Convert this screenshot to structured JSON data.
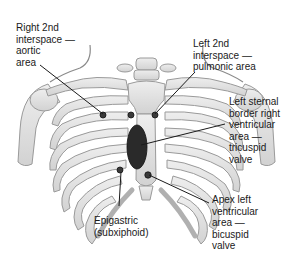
{
  "diagram": {
    "colors": {
      "bone_fill": "#e4e4e4",
      "bone_stroke": "#9a9a9a",
      "heart_area": "#2a2a2a",
      "leader_line": "#1a1a1a",
      "text": "#1a1a1a"
    },
    "labels": [
      {
        "id": "aortic",
        "lines": [
          "Right 2nd",
          "interspace —",
          "aortic",
          "area"
        ]
      },
      {
        "id": "pulmonic",
        "lines": [
          "Left 2nd",
          "interspace —",
          "pulmonic area"
        ]
      },
      {
        "id": "tricuspid",
        "lines": [
          "Left sternal",
          "border right",
          "ventricular",
          "area —",
          "tricuspid",
          "valve"
        ]
      },
      {
        "id": "bicuspid",
        "lines": [
          "Apex left",
          "ventricular",
          "area —",
          "bicuspid",
          "valve"
        ]
      },
      {
        "id": "epigastric",
        "lines": [
          "Epigastric",
          "(subxiphoid)"
        ]
      }
    ]
  }
}
